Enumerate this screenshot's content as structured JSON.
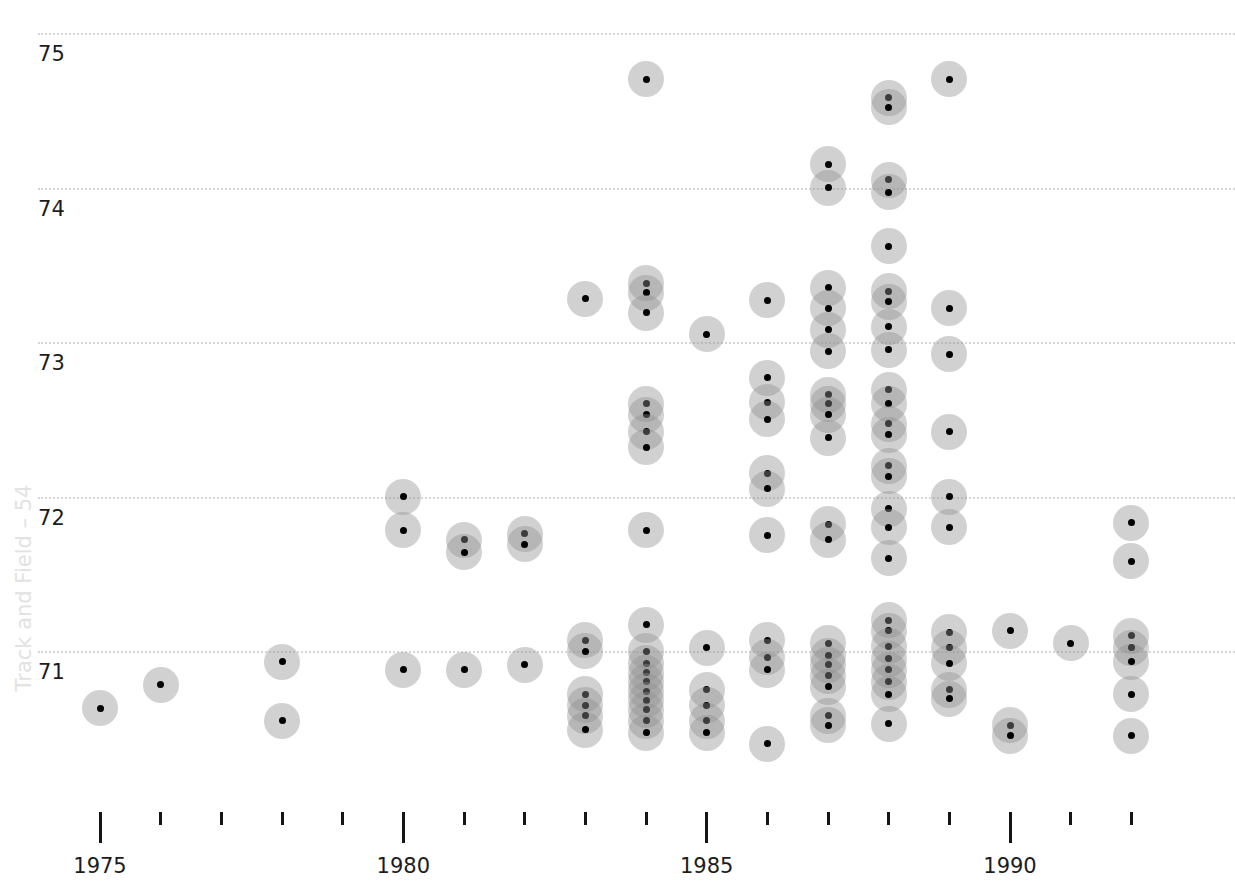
{
  "chart_data": {
    "type": "scatter",
    "title": "",
    "subtitle": "",
    "xlabel": "",
    "ylabel": "Track and Field – 54",
    "xlim": [
      1974,
      1992.6
    ],
    "ylim": [
      70.4,
      75.1
    ],
    "grid": true,
    "legend": null,
    "y_ticks": [
      75,
      74,
      73,
      72,
      71
    ],
    "y_tick_labels": [
      "75",
      "74",
      "73",
      "72",
      "71"
    ],
    "x_major_ticks": [
      1975,
      1980,
      1985,
      1990
    ],
    "x_major_tick_labels": [
      "1975",
      "1980",
      "1985",
      "1990"
    ],
    "x_minor_ticks": [
      1976,
      1977,
      1978,
      1979,
      1981,
      1982,
      1983,
      1984,
      1986,
      1987,
      1988,
      1989,
      1991,
      1992
    ],
    "marker": {
      "shape": "circle",
      "halo_color": "#929292",
      "halo_opacity": 0.42,
      "core_color": "#000000",
      "diameter_px": 36
    },
    "gridline_color": "#d6d6d6",
    "axis_color": "#151515",
    "background": "#ffffff",
    "points": [
      {
        "x": 1975.0,
        "y": 70.63
      },
      {
        "x": 1976.0,
        "y": 70.78
      },
      {
        "x": 1978.0,
        "y": 70.93
      },
      {
        "x": 1978.0,
        "y": 70.55
      },
      {
        "x": 1980.0,
        "y": 72.0
      },
      {
        "x": 1980.0,
        "y": 71.78
      },
      {
        "x": 1980.0,
        "y": 70.88
      },
      {
        "x": 1981.0,
        "y": 71.72
      },
      {
        "x": 1981.0,
        "y": 71.64
      },
      {
        "x": 1981.0,
        "y": 70.88
      },
      {
        "x": 1982.0,
        "y": 71.76
      },
      {
        "x": 1982.0,
        "y": 71.69
      },
      {
        "x": 1982.0,
        "y": 70.91
      },
      {
        "x": 1983.0,
        "y": 73.28
      },
      {
        "x": 1983.0,
        "y": 71.07
      },
      {
        "x": 1983.0,
        "y": 71.0
      },
      {
        "x": 1983.0,
        "y": 70.72
      },
      {
        "x": 1983.0,
        "y": 70.65
      },
      {
        "x": 1983.0,
        "y": 70.58
      },
      {
        "x": 1983.0,
        "y": 70.49
      },
      {
        "x": 1984.0,
        "y": 74.7
      },
      {
        "x": 1984.0,
        "y": 73.38
      },
      {
        "x": 1984.0,
        "y": 73.32
      },
      {
        "x": 1984.0,
        "y": 73.19
      },
      {
        "x": 1984.0,
        "y": 72.6
      },
      {
        "x": 1984.0,
        "y": 72.53
      },
      {
        "x": 1984.0,
        "y": 72.42
      },
      {
        "x": 1984.0,
        "y": 72.32
      },
      {
        "x": 1984.0,
        "y": 71.78
      },
      {
        "x": 1984.0,
        "y": 71.17
      },
      {
        "x": 1984.0,
        "y": 71.0
      },
      {
        "x": 1984.0,
        "y": 70.92
      },
      {
        "x": 1984.0,
        "y": 70.86
      },
      {
        "x": 1984.0,
        "y": 70.8
      },
      {
        "x": 1984.0,
        "y": 70.74
      },
      {
        "x": 1984.0,
        "y": 70.68
      },
      {
        "x": 1984.0,
        "y": 70.62
      },
      {
        "x": 1984.0,
        "y": 70.55
      },
      {
        "x": 1984.0,
        "y": 70.47
      },
      {
        "x": 1985.0,
        "y": 73.05
      },
      {
        "x": 1985.0,
        "y": 71.02
      },
      {
        "x": 1985.0,
        "y": 70.75
      },
      {
        "x": 1985.0,
        "y": 70.65
      },
      {
        "x": 1985.0,
        "y": 70.55
      },
      {
        "x": 1985.0,
        "y": 70.47
      },
      {
        "x": 1986.0,
        "y": 73.27
      },
      {
        "x": 1986.0,
        "y": 72.77
      },
      {
        "x": 1986.0,
        "y": 72.61
      },
      {
        "x": 1986.0,
        "y": 72.5
      },
      {
        "x": 1986.0,
        "y": 72.15
      },
      {
        "x": 1986.0,
        "y": 72.05
      },
      {
        "x": 1986.0,
        "y": 71.75
      },
      {
        "x": 1986.0,
        "y": 71.07
      },
      {
        "x": 1986.0,
        "y": 70.96
      },
      {
        "x": 1986.0,
        "y": 70.88
      },
      {
        "x": 1986.0,
        "y": 70.4
      },
      {
        "x": 1987.0,
        "y": 74.15
      },
      {
        "x": 1987.0,
        "y": 74.0
      },
      {
        "x": 1987.0,
        "y": 73.35
      },
      {
        "x": 1987.0,
        "y": 73.22
      },
      {
        "x": 1987.0,
        "y": 73.08
      },
      {
        "x": 1987.0,
        "y": 72.94
      },
      {
        "x": 1987.0,
        "y": 72.66
      },
      {
        "x": 1987.0,
        "y": 72.6
      },
      {
        "x": 1987.0,
        "y": 72.53
      },
      {
        "x": 1987.0,
        "y": 72.38
      },
      {
        "x": 1987.0,
        "y": 71.82
      },
      {
        "x": 1987.0,
        "y": 71.72
      },
      {
        "x": 1987.0,
        "y": 71.05
      },
      {
        "x": 1987.0,
        "y": 70.97
      },
      {
        "x": 1987.0,
        "y": 70.91
      },
      {
        "x": 1987.0,
        "y": 70.84
      },
      {
        "x": 1987.0,
        "y": 70.77
      },
      {
        "x": 1987.0,
        "y": 70.58
      },
      {
        "x": 1987.0,
        "y": 70.52
      },
      {
        "x": 1988.0,
        "y": 74.58
      },
      {
        "x": 1988.0,
        "y": 74.52
      },
      {
        "x": 1988.0,
        "y": 74.05
      },
      {
        "x": 1988.0,
        "y": 73.97
      },
      {
        "x": 1988.0,
        "y": 73.62
      },
      {
        "x": 1988.0,
        "y": 73.33
      },
      {
        "x": 1988.0,
        "y": 73.26
      },
      {
        "x": 1988.0,
        "y": 73.1
      },
      {
        "x": 1988.0,
        "y": 72.95
      },
      {
        "x": 1988.0,
        "y": 72.69
      },
      {
        "x": 1988.0,
        "y": 72.6
      },
      {
        "x": 1988.0,
        "y": 72.47
      },
      {
        "x": 1988.0,
        "y": 72.4
      },
      {
        "x": 1988.0,
        "y": 72.2
      },
      {
        "x": 1988.0,
        "y": 72.13
      },
      {
        "x": 1988.0,
        "y": 71.92
      },
      {
        "x": 1988.0,
        "y": 71.8
      },
      {
        "x": 1988.0,
        "y": 71.6
      },
      {
        "x": 1988.0,
        "y": 71.2
      },
      {
        "x": 1988.0,
        "y": 71.13
      },
      {
        "x": 1988.0,
        "y": 71.03
      },
      {
        "x": 1988.0,
        "y": 70.95
      },
      {
        "x": 1988.0,
        "y": 70.88
      },
      {
        "x": 1988.0,
        "y": 70.8
      },
      {
        "x": 1988.0,
        "y": 70.72
      },
      {
        "x": 1988.0,
        "y": 70.53
      },
      {
        "x": 1989.0,
        "y": 74.7
      },
      {
        "x": 1989.0,
        "y": 73.22
      },
      {
        "x": 1989.0,
        "y": 72.92
      },
      {
        "x": 1989.0,
        "y": 72.42
      },
      {
        "x": 1989.0,
        "y": 72.0
      },
      {
        "x": 1989.0,
        "y": 71.8
      },
      {
        "x": 1989.0,
        "y": 71.12
      },
      {
        "x": 1989.0,
        "y": 71.02
      },
      {
        "x": 1989.0,
        "y": 70.92
      },
      {
        "x": 1989.0,
        "y": 70.75
      },
      {
        "x": 1989.0,
        "y": 70.69
      },
      {
        "x": 1990.0,
        "y": 71.13
      },
      {
        "x": 1990.0,
        "y": 70.52
      },
      {
        "x": 1990.0,
        "y": 70.45
      },
      {
        "x": 1991.0,
        "y": 71.05
      },
      {
        "x": 1992.0,
        "y": 71.83
      },
      {
        "x": 1992.0,
        "y": 71.58
      },
      {
        "x": 1992.0,
        "y": 71.1
      },
      {
        "x": 1992.0,
        "y": 71.02
      },
      {
        "x": 1992.0,
        "y": 70.93
      },
      {
        "x": 1992.0,
        "y": 70.72
      },
      {
        "x": 1992.0,
        "y": 70.45
      }
    ]
  }
}
